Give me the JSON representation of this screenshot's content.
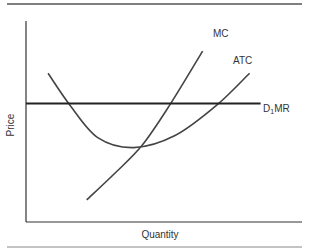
{
  "chart_data": {
    "type": "line",
    "title": "",
    "xlabel": "Quantity",
    "ylabel": "Price",
    "xlim": [
      0,
      10
    ],
    "ylim": [
      0,
      10
    ],
    "grid": false,
    "legend": "none",
    "series": [
      {
        "name": "MC",
        "label": "MC",
        "points": [
          [
            2.2,
            1.1
          ],
          [
            3.2,
            2.4
          ],
          [
            4.2,
            3.8
          ],
          [
            5.2,
            5.8
          ],
          [
            6.4,
            8.5
          ]
        ]
      },
      {
        "name": "ATC",
        "label": "ATC",
        "points": [
          [
            0.8,
            7.4
          ],
          [
            1.6,
            5.8
          ],
          [
            2.6,
            4.2
          ],
          [
            3.9,
            3.7
          ],
          [
            5.4,
            4.3
          ],
          [
            6.9,
            5.8
          ],
          [
            8.1,
            7.4
          ]
        ]
      },
      {
        "name": "D1MR",
        "label_main": "D",
        "label_sub": "1",
        "label_rest": "MR",
        "points": [
          [
            0,
            5.9
          ],
          [
            8.5,
            5.9
          ]
        ]
      }
    ]
  }
}
